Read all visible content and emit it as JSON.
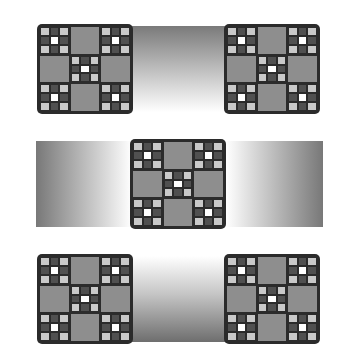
{
  "figure": {
    "block_pattern": {
      "grid": "3x3",
      "patch_cells": [
        "corner",
        "center"
      ],
      "plain_cells": [
        "edge"
      ],
      "patch_grid": [
        [
          "l",
          "d",
          "l"
        ],
        [
          "d",
          "w",
          "d"
        ],
        [
          "l",
          "d",
          "l"
        ]
      ]
    },
    "colors": {
      "frame": "#2b2b2b",
      "plain_cell": "#8e8e8e",
      "light_square": "#c9c9c9",
      "dark_square": "#505050",
      "white_square": "#ffffff",
      "background": "#ffffff"
    },
    "rows": [
      {
        "name": "top",
        "blocks": 2,
        "band": "vertical gradient, dark at top"
      },
      {
        "name": "middle",
        "blocks": 1,
        "bands": [
          "horizontal gradient, dark at left",
          "horizontal gradient, dark at right"
        ]
      },
      {
        "name": "bottom",
        "blocks": 2,
        "band": "vertical gradient, dark at bottom"
      }
    ]
  }
}
